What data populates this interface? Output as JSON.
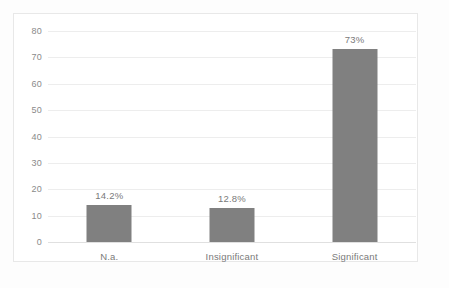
{
  "chart_data": {
    "type": "bar",
    "title": "",
    "subtitle": "",
    "xlabel": "",
    "ylabel": "",
    "categories": [
      "N.a.",
      "Insignificant",
      "Significant"
    ],
    "values": [
      14.2,
      12.8,
      73
    ],
    "data_labels": [
      "14.2%",
      "12.8%",
      "73%"
    ],
    "ylim": [
      0,
      80
    ],
    "yticks": [
      0,
      10,
      20,
      30,
      40,
      50,
      60,
      70,
      80
    ],
    "ytick_labels": [
      "0",
      "10",
      "20",
      "30",
      "40",
      "50",
      "60",
      "70",
      "80"
    ],
    "grid": true,
    "legend": false,
    "bar_color": "#808080",
    "gridline_color": "#ededed",
    "axis_text_color": "#8a8a8a",
    "label_text_color": "#7a7a7a",
    "plot_background": "#ffffff",
    "border_color": "#e8e8e8"
  }
}
